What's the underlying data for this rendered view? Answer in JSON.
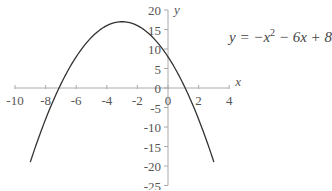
{
  "chart_data": {
    "type": "line",
    "title": "",
    "equation": {
      "prefix": "y = −x",
      "exp": "2",
      "suffix": " − 6x + 8"
    },
    "xlabel": "x",
    "ylabel": "y",
    "xlim": [
      -10,
      4
    ],
    "ylim": [
      -25,
      20
    ],
    "x_ticks": [
      -10,
      -8,
      -6,
      -4,
      -2,
      0,
      2,
      4
    ],
    "y_ticks": [
      20,
      15,
      10,
      5,
      0,
      -5,
      -10,
      -15,
      -20,
      -25
    ],
    "grid": false,
    "series": [
      {
        "name": "y = -x^2 - 6x + 8",
        "x": [
          -9,
          -8,
          -7,
          -6,
          -5,
          -4,
          -3,
          -2,
          -1,
          0,
          1,
          2,
          3
        ],
        "values": [
          -19,
          -8,
          1,
          8,
          13,
          16,
          17,
          16,
          13,
          8,
          1,
          -8,
          -19
        ]
      }
    ],
    "colors": {
      "curve": "#333333",
      "axis": "#aaaaaa",
      "text": "#555555"
    }
  }
}
